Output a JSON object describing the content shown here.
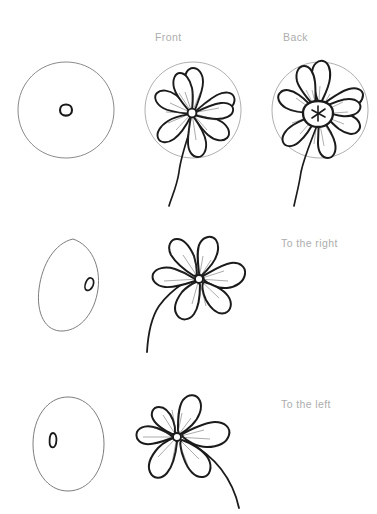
{
  "page": {
    "background_color": "#ffffff",
    "width": 377,
    "height": 514
  },
  "colors": {
    "ink": "#1b1b1b",
    "guide": "#6e6e6e",
    "guide_light": "#8a8a8a",
    "label_text": "#adadad"
  },
  "labels": {
    "front": "Front",
    "back": "Back",
    "to_the_right": "To the right",
    "to_the_left": "To the left"
  },
  "rows": [
    {
      "name": "row-front-back",
      "guide": {
        "name": "guide-circle-front",
        "shape": "circle",
        "center_dot": "small-ring"
      },
      "drawings": [
        {
          "name": "flower-front",
          "label": "Front",
          "petals": 8,
          "center": "small-disc",
          "stem": "straight-down"
        },
        {
          "name": "flower-back",
          "label": "Back",
          "petals": 8,
          "center": "star-calyx",
          "stem": "straight-down"
        }
      ]
    },
    {
      "name": "row-to-the-right",
      "guide": {
        "name": "guide-ellipse-right",
        "shape": "tilted-ellipse",
        "center_dot": "small-slanted-ring-right"
      },
      "drawings": [
        {
          "name": "flower-to-the-right",
          "label": "To the right",
          "petals": 6,
          "center": "small-disc",
          "stem": "curved-left-down"
        }
      ]
    },
    {
      "name": "row-to-the-left",
      "guide": {
        "name": "guide-ellipse-left",
        "shape": "upright-ellipse",
        "center_dot": "small-slanted-ring-left"
      },
      "drawings": [
        {
          "name": "flower-to-the-left",
          "label": "To the left",
          "petals": 6,
          "center": "small-disc",
          "stem": "curved-right-down"
        }
      ]
    }
  ]
}
